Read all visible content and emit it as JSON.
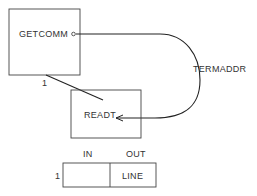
{
  "modules": {
    "getcomm": {
      "label": "GETCOMM"
    },
    "readt": {
      "label": "READT"
    }
  },
  "connection": {
    "invocation_label": "1"
  },
  "couple": {
    "data_label": "TERMADDR"
  },
  "interface_table": {
    "row_label": "1",
    "columns": [
      "IN",
      "OUT"
    ],
    "rows": [
      {
        "in": "",
        "out": "LINE"
      }
    ]
  },
  "colors": {
    "line": "#222222",
    "text": "#333333",
    "background": "#ffffff"
  }
}
